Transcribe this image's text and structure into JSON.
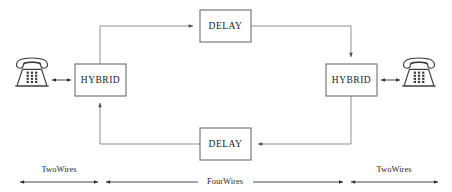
{
  "diagram": {
    "colors": {
      "wire": "#8f8f8f",
      "wire_dark": "#4a4a4a",
      "box_border": "#6e6e6e",
      "text": "#1a1a1a",
      "background": "#ffffff"
    },
    "blocks": [
      {
        "id": "delay_top",
        "label": "DELAY",
        "x": 200,
        "y": 10,
        "w": 51,
        "h": 32
      },
      {
        "id": "hybrid_left",
        "label": "HYBRID",
        "x": 75,
        "y": 64,
        "w": 51,
        "h": 32
      },
      {
        "id": "hybrid_right",
        "label": "HYBRID",
        "x": 326,
        "y": 64,
        "w": 51,
        "h": 32
      },
      {
        "id": "delay_bottom",
        "label": "DELAY",
        "x": 200,
        "y": 128,
        "w": 51,
        "h": 32
      }
    ],
    "endpoints": [
      {
        "id": "phone_left",
        "name": "telephone-left",
        "cx": 32,
        "cy": 78
      },
      {
        "id": "phone_right",
        "name": "telephone-right",
        "cx": 419,
        "cy": 78
      }
    ],
    "spans": [
      {
        "id": "span_left",
        "label": "TwoWires",
        "x1": 18,
        "x2": 100,
        "label_x": 59,
        "label_y": 170,
        "line_y": 182
      },
      {
        "id": "span_center",
        "label": "FourWires",
        "x1": 104,
        "x2": 345,
        "label_x": 225,
        "label_y": 182,
        "line_y": 182
      },
      {
        "id": "span_right",
        "label": "TwoWires",
        "x1": 349,
        "x2": 440,
        "label_x": 394,
        "label_y": 170,
        "line_y": 182
      }
    ]
  }
}
